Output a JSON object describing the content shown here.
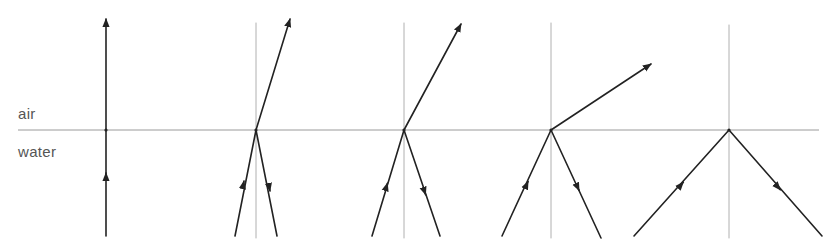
{
  "labels": {
    "upper_medium": "air",
    "lower_medium": "water"
  },
  "colors": {
    "background": "#ffffff",
    "ray": "#222222",
    "normal": "#b0b0b0",
    "interface": "#9a9a9a",
    "label": "#555555"
  },
  "interface": {
    "y": 130,
    "x1": 18,
    "x2": 819
  },
  "panels": [
    {
      "name": "normal-incidence",
      "point": [
        106,
        130
      ],
      "normal": null,
      "incident": {
        "from": [
          106,
          236
        ],
        "arrow_at": [
          106,
          178
        ]
      },
      "reflected": null,
      "refracted": {
        "to": [
          106,
          19
        ]
      }
    },
    {
      "name": "small-angle",
      "point": [
        256,
        130
      ],
      "normal": {
        "x": 256,
        "y1": 23,
        "y2": 238
      },
      "incident": {
        "from": [
          235,
          236
        ],
        "arrow_at": [
          243,
          186
        ]
      },
      "reflected": {
        "to": [
          277,
          236
        ],
        "arrow_at": [
          269,
          186
        ]
      },
      "refracted": {
        "to": [
          290,
          19
        ]
      }
    },
    {
      "name": "medium-angle",
      "point": [
        404,
        130
      ],
      "normal": {
        "x": 404,
        "y1": 23,
        "y2": 238
      },
      "incident": {
        "from": [
          372,
          236
        ],
        "arrow_at": [
          386,
          188
        ]
      },
      "reflected": {
        "to": [
          440,
          236
        ],
        "arrow_at": [
          424,
          190
        ]
      },
      "refracted": {
        "to": [
          461,
          24
        ]
      }
    },
    {
      "name": "near-critical-angle",
      "point": [
        551,
        130
      ],
      "normal": {
        "x": 551,
        "y1": 23,
        "y2": 238
      },
      "incident": {
        "from": [
          502,
          236
        ],
        "arrow_at": [
          526,
          186
        ]
      },
      "reflected": {
        "to": [
          601,
          238
        ],
        "arrow_at": [
          577,
          186
        ]
      },
      "refracted": {
        "to": [
          651,
          64
        ]
      }
    },
    {
      "name": "total-internal-reflection",
      "point": [
        729,
        130
      ],
      "normal": {
        "x": 729,
        "y1": 25,
        "y2": 238
      },
      "incident": {
        "from": [
          634,
          236
        ],
        "arrow_at": [
          680,
          186
        ]
      },
      "reflected": {
        "to": [
          822,
          236
        ],
        "arrow_at": [
          777,
          186
        ]
      },
      "refracted": null
    }
  ]
}
